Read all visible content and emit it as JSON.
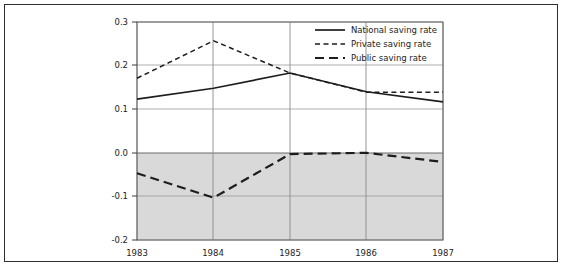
{
  "chart_data": {
    "type": "line",
    "title": "",
    "xlabel": "",
    "ylabel": "",
    "categories": [
      "1983",
      "1984",
      "1985",
      "1986",
      "1987"
    ],
    "x_tick_labels": [
      "1983",
      "1984",
      "1985",
      "1986",
      "1987"
    ],
    "y_tick_labels": [
      "0.3",
      "0.2",
      "0.1",
      "0.0",
      "-0.1",
      "-0.2"
    ],
    "y_tick_values": [
      0.3,
      0.2,
      0.1,
      0.0,
      -0.1,
      -0.2
    ],
    "ylim": [
      -0.2,
      0.3
    ],
    "xlim": [
      1983,
      1987
    ],
    "grid": true,
    "legend_position": "top-right",
    "negative_region_shaded": true,
    "shade_color": "#d9d9d9",
    "line_color": "#1d1d1d",
    "series": [
      {
        "name": "National saving rate",
        "style": "solid",
        "values": [
          0.123,
          0.148,
          0.183,
          0.14,
          0.117
        ]
      },
      {
        "name": "Private saving rate",
        "style": "short-dash",
        "values": [
          0.171,
          0.257,
          0.183,
          0.139,
          0.139
        ]
      },
      {
        "name": "Public saving rate",
        "style": "long-dash",
        "values": [
          -0.047,
          -0.103,
          -0.003,
          0.0,
          -0.021
        ]
      }
    ]
  },
  "legend": {
    "items": [
      {
        "label": "National saving rate",
        "style": "solid"
      },
      {
        "label": "Private saving rate",
        "style": "short-dash"
      },
      {
        "label": "Public saving rate",
        "style": "long-dash"
      }
    ]
  },
  "axes": {
    "y_labels": [
      "0.3",
      "0.2",
      "0.1",
      "0.0",
      "-0.1",
      "-0.2"
    ],
    "x_labels": [
      "1983",
      "1984",
      "1985",
      "1986",
      "1987"
    ]
  }
}
